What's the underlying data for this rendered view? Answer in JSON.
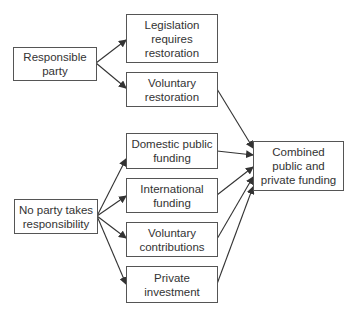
{
  "diagram": {
    "nodes": {
      "responsible": {
        "label": "Responsible\nparty"
      },
      "no_party": {
        "label": "No party takes\nresponsibility"
      },
      "legislation": {
        "label": "Legislation\nrequires\nrestoration"
      },
      "voluntary_restoration": {
        "label": "Voluntary\nrestoration"
      },
      "domestic": {
        "label": "Domestic public\nfunding"
      },
      "international": {
        "label": "International\nfunding"
      },
      "voluntary_contrib": {
        "label": "Voluntary\ncontributions"
      },
      "private": {
        "label": "Private\ninvestment"
      },
      "combined": {
        "label": "Combined\npublic and\nprivate funding"
      }
    },
    "edges": [
      {
        "from": "responsible",
        "to": "legislation"
      },
      {
        "from": "responsible",
        "to": "voluntary_restoration"
      },
      {
        "from": "no_party",
        "to": "domestic"
      },
      {
        "from": "no_party",
        "to": "international"
      },
      {
        "from": "no_party",
        "to": "voluntary_contrib"
      },
      {
        "from": "no_party",
        "to": "private"
      },
      {
        "from": "voluntary_restoration",
        "to": "combined"
      },
      {
        "from": "domestic",
        "to": "combined"
      },
      {
        "from": "international",
        "to": "combined"
      },
      {
        "from": "voluntary_contrib",
        "to": "combined"
      },
      {
        "from": "private",
        "to": "combined"
      }
    ],
    "colors": {
      "line": "#333333",
      "border": "#555555",
      "text": "#333333"
    }
  }
}
